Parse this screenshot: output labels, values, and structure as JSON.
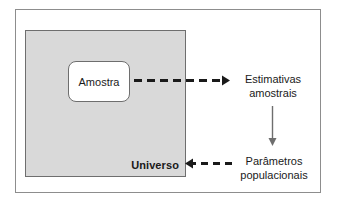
{
  "diagram": {
    "frame": {
      "border_color": "#8d8d8d"
    },
    "universe": {
      "label": "Universo",
      "fill_color": "#d9d9d9",
      "border_color": "#6e6e6e"
    },
    "sample": {
      "label": "Amostra",
      "fill_color": "#ffffff",
      "border_color": "#6e6e6e"
    },
    "estimates": {
      "line1": "Estimativas",
      "line2": "amostrais"
    },
    "parameters": {
      "line1": "Parâmetros",
      "line2": "populacionais"
    },
    "arrows": {
      "sample_to_estimates": {
        "name": "dashed-arrow-right",
        "style": "dashed",
        "direction": "right",
        "color": "#1a1a1a"
      },
      "estimates_to_parameters": {
        "name": "solid-arrow-down",
        "style": "solid",
        "direction": "down",
        "color": "#6e6e6e"
      },
      "parameters_to_universe": {
        "name": "dashed-arrow-left",
        "style": "dashed",
        "direction": "left",
        "color": "#1a1a1a"
      }
    }
  }
}
